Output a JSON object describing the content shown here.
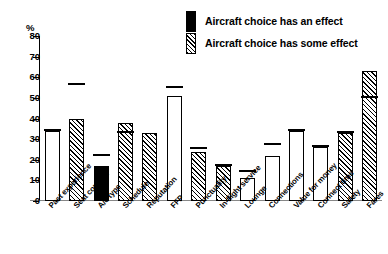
{
  "legend": {
    "items": [
      {
        "label": "Aircraft choice has an effect",
        "swatch": "solid-black-bar-icon"
      },
      {
        "label": "Aircraft choice has some effect",
        "swatch": "hatched-bar-icon"
      }
    ]
  },
  "axis": {
    "y_unit_label": "%",
    "y_ticks": [
      "80",
      "70",
      "60",
      "50",
      "40",
      "30",
      "20",
      "10",
      "0"
    ]
  },
  "chart_data": {
    "type": "bar",
    "title": "",
    "subtitle": "",
    "xlabel": "",
    "ylabel": "%",
    "ylim": [
      0,
      80
    ],
    "ytick_values": [
      0,
      10,
      20,
      30,
      40,
      50,
      60,
      70,
      80
    ],
    "grid": false,
    "legend_position": "top-right",
    "legend_entries": [
      "Aircraft choice has an effect",
      "Aircraft choice has some effect"
    ],
    "categories": [
      "Past experience",
      "Seat comfort",
      "A/c type",
      "Schedule",
      "Reputation",
      "FFP",
      "Punctuality",
      "In-flight service",
      "Lounge",
      "Connections",
      "Value for money",
      "Connect time",
      "Safety",
      "Fares"
    ],
    "series": [
      {
        "name": "Bar value",
        "values": [
          34,
          40,
          17,
          38,
          33,
          51,
          24,
          17,
          11,
          22,
          34,
          26,
          33,
          63
        ]
      },
      {
        "name": "Marker value",
        "values": [
          35,
          57,
          23,
          34,
          null,
          56,
          26,
          18,
          15,
          28,
          35,
          27,
          34,
          51
        ]
      }
    ],
    "bar_fills": [
      "white",
      "hatched",
      "black",
      "hatched",
      "hatched",
      "white",
      "hatched",
      "hatched",
      "white",
      "white",
      "white",
      "white",
      "hatched",
      "hatched"
    ]
  }
}
